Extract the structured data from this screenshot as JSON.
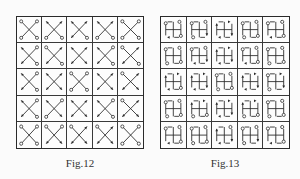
{
  "figures": [
    {
      "id": "fig12",
      "caption": "Fig.12",
      "glyph": "x-cross",
      "rows": 5,
      "cols": 5,
      "cells": [
        [
          {
            "tl": "o",
            "tr": "o",
            "bl": "o",
            "br": "o"
          },
          {
            "tl": "a",
            "tr": "a",
            "bl": "o",
            "br": "o"
          },
          {
            "tl": "a",
            "tr": "a",
            "bl": "a",
            "br": "o"
          },
          {
            "tl": "a",
            "tr": "a",
            "bl": "o",
            "br": "o"
          },
          {
            "tl": "o",
            "tr": "o",
            "bl": "o",
            "br": "o"
          }
        ],
        [
          {
            "tl": "a",
            "tr": "o",
            "bl": "a",
            "br": "o"
          },
          {
            "tl": "o",
            "tr": "a",
            "bl": "a",
            "br": "o"
          },
          {
            "tl": "a",
            "tr": "a",
            "bl": "a",
            "br": "a"
          },
          {
            "tl": "a",
            "tr": "o",
            "bl": "a",
            "br": "o"
          },
          {
            "tl": "o",
            "tr": "a",
            "bl": "a",
            "br": "o"
          }
        ],
        [
          {
            "tl": "a",
            "tr": "o",
            "bl": "a",
            "br": "o"
          },
          {
            "tl": "a",
            "tr": "a",
            "bl": "a",
            "br": "a"
          },
          {
            "tl": "o",
            "tr": "o",
            "bl": "o",
            "br": "o"
          },
          {
            "tl": "a",
            "tr": "a",
            "bl": "a",
            "br": "a"
          },
          {
            "tl": "o",
            "tr": "a",
            "bl": "a",
            "br": "a"
          }
        ],
        [
          {
            "tl": "a",
            "tr": "o",
            "bl": "a",
            "br": "o"
          },
          {
            "tl": "a",
            "tr": "o",
            "bl": "o",
            "br": "a"
          },
          {
            "tl": "a",
            "tr": "a",
            "bl": "a",
            "br": "a"
          },
          {
            "tl": "a",
            "tr": "o",
            "bl": "a",
            "br": "o"
          },
          {
            "tl": "o",
            "tr": "a",
            "bl": "a",
            "br": "a"
          }
        ],
        [
          {
            "tl": "o",
            "tr": "o",
            "bl": "o",
            "br": "o"
          },
          {
            "tl": "o",
            "tr": "o",
            "bl": "a",
            "br": "a"
          },
          {
            "tl": "o",
            "tr": "a",
            "bl": "a",
            "br": "a"
          },
          {
            "tl": "o",
            "tr": "a",
            "bl": "a",
            "br": "a"
          },
          {
            "tl": "o",
            "tr": "o",
            "bl": "o",
            "br": "o"
          }
        ]
      ]
    },
    {
      "id": "fig13",
      "caption": "Fig.13",
      "glyph": "plus-with-frame",
      "rows": 5,
      "cols": 5,
      "cells": [
        [
          {
            "tl": "o",
            "tr": "o",
            "bl": "a",
            "br": "o"
          },
          {
            "tl": "o",
            "tr": "o",
            "bl": "o",
            "br": "a"
          },
          {
            "tl": "a",
            "tr": "a",
            "bl": "a",
            "br": "a"
          },
          {
            "tl": "o",
            "tr": "o",
            "bl": "o",
            "br": "o"
          },
          {
            "tl": "o",
            "tr": "o",
            "bl": "a",
            "br": "o"
          }
        ],
        [
          {
            "tl": "o",
            "tr": "o",
            "bl": "o",
            "br": "o"
          },
          {
            "tl": "o",
            "tr": "o",
            "bl": "a",
            "br": "a"
          },
          {
            "tl": "a",
            "tr": "a",
            "bl": "a",
            "br": "a"
          },
          {
            "tl": "o",
            "tr": "o",
            "bl": "a",
            "br": "o"
          },
          {
            "tl": "o",
            "tr": "o",
            "bl": "o",
            "br": "o"
          }
        ],
        [
          {
            "tl": "a",
            "tr": "a",
            "bl": "a",
            "br": "o"
          },
          {
            "tl": "a",
            "tr": "a",
            "bl": "a",
            "br": "a"
          },
          {
            "tl": "o",
            "tr": "o",
            "bl": "o",
            "br": "o"
          },
          {
            "tl": "a",
            "tr": "a",
            "bl": "a",
            "br": "a"
          },
          {
            "tl": "o",
            "tr": "a",
            "bl": "o",
            "br": "a"
          }
        ],
        [
          {
            "tl": "o",
            "tr": "o",
            "bl": "o",
            "br": "o"
          },
          {
            "tl": "a",
            "tr": "a",
            "bl": "o",
            "br": "o"
          },
          {
            "tl": "a",
            "tr": "a",
            "bl": "a",
            "br": "a"
          },
          {
            "tl": "a",
            "tr": "a",
            "bl": "o",
            "br": "o"
          },
          {
            "tl": "o",
            "tr": "o",
            "bl": "o",
            "br": "o"
          }
        ],
        [
          {
            "tl": "o",
            "tr": "o",
            "bl": "a",
            "br": "o"
          },
          {
            "tl": "o",
            "tr": "o",
            "bl": "o",
            "br": "o"
          },
          {
            "tl": "a",
            "tr": "o",
            "bl": "a",
            "br": "a"
          },
          {
            "tl": "o",
            "tr": "o",
            "bl": "o",
            "br": "a"
          },
          {
            "tl": "o",
            "tr": "o",
            "bl": "a",
            "br": "o"
          }
        ]
      ]
    }
  ],
  "colors": {
    "ink": "#2a2a2a",
    "background": "#fbfbfb"
  }
}
